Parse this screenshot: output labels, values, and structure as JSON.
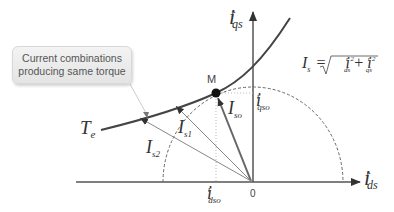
{
  "callout": {
    "line1": "Current combinations",
    "line2": "producing same torque"
  },
  "axes": {
    "y_label": {
      "main": "i",
      "sup": "r",
      "sub": "qs"
    },
    "x_label": {
      "main": "i",
      "sup": "r",
      "sub": "ds"
    },
    "origin": "0"
  },
  "labels": {
    "point_m": "M",
    "torque_curve": {
      "main": "T",
      "sub": "e"
    },
    "i_qso": {
      "main": "i",
      "sup": "r",
      "sub": "qso"
    },
    "i_dso": {
      "main": "i",
      "sup": "r",
      "sub": "dso"
    },
    "I_so": {
      "main": "I",
      "sub": "so"
    },
    "I_s1": {
      "main": "I",
      "sub": "s1"
    },
    "I_s2": {
      "main": "I",
      "sub": "s2"
    }
  },
  "formula": {
    "lhs": "I",
    "lhs_sub": "s",
    "eq": "=",
    "term1": "i",
    "term1_sup": "r 2",
    "term1_sub": "ds",
    "plus": "+",
    "term2": "i",
    "term2_sup": "r 2",
    "term2_sub": "qs"
  },
  "colors": {
    "axis": "#555555",
    "curve": "#444444",
    "vector_main": "#666666",
    "vector_light": "#888888",
    "dashed": "#666666",
    "callout_bg": "#ececec",
    "callout_text": "#555555"
  }
}
